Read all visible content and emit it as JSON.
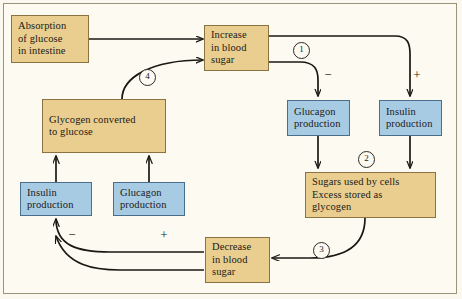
{
  "diagram": {
    "background_color": "#fcfaf1",
    "tan_fill": "#e9ce8f",
    "blue_fill": "#a8cbe4",
    "nodes": [
      {
        "id": "absorption",
        "lines": [
          "Absorption",
          "of glucose",
          "in intestine"
        ],
        "color": "tan"
      },
      {
        "id": "increase",
        "lines": [
          "Increase",
          "in blood",
          "sugar"
        ],
        "color": "tan"
      },
      {
        "id": "glucagon-top",
        "lines": [
          "Glucagon",
          "production"
        ],
        "color": "blue"
      },
      {
        "id": "insulin-top",
        "lines": [
          "Insulin",
          "production"
        ],
        "color": "blue"
      },
      {
        "id": "sugars-used",
        "lines": [
          "Sugars used by cells",
          "Excess stored as",
          "glycogen"
        ],
        "color": "tan"
      },
      {
        "id": "decrease",
        "lines": [
          "Decrease",
          "in blood",
          "sugar"
        ],
        "color": "tan"
      },
      {
        "id": "insulin-bottom",
        "lines": [
          "Insulin",
          "production"
        ],
        "color": "blue"
      },
      {
        "id": "glucagon-bottom",
        "lines": [
          "Glucagon",
          "production"
        ],
        "color": "blue"
      },
      {
        "id": "glycogen-converted",
        "lines": [
          "Glycogen converted",
          "to glucose"
        ],
        "color": "tan"
      }
    ],
    "step_markers": [
      {
        "id": "step-1",
        "label": "1"
      },
      {
        "id": "step-2",
        "label": "2"
      },
      {
        "id": "step-3",
        "label": "3"
      },
      {
        "id": "step-4",
        "label": "4"
      }
    ],
    "signs": [
      {
        "id": "sign-minus-glucagon-top",
        "label": "−"
      },
      {
        "id": "sign-plus-insulin-top",
        "label": "+"
      },
      {
        "id": "sign-minus-insulin-bottom",
        "label": "−"
      },
      {
        "id": "sign-plus-glucagon-bottom",
        "label": "+"
      }
    ]
  }
}
